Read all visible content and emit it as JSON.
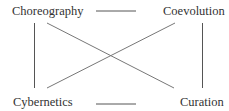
{
  "diagram": {
    "nodes": [
      {
        "id": "choreography",
        "label": "Choreography"
      },
      {
        "id": "coevolution",
        "label": "Coevolution"
      },
      {
        "id": "cybernetics",
        "label": "Cybernetics"
      },
      {
        "id": "curation",
        "label": "Curation"
      }
    ],
    "edges": [
      [
        "choreography",
        "coevolution"
      ],
      [
        "choreography",
        "cybernetics"
      ],
      [
        "choreography",
        "curation"
      ],
      [
        "coevolution",
        "curation"
      ],
      [
        "coevolution",
        "cybernetics"
      ],
      [
        "cybernetics",
        "curation"
      ]
    ],
    "line_color": "#555555"
  }
}
